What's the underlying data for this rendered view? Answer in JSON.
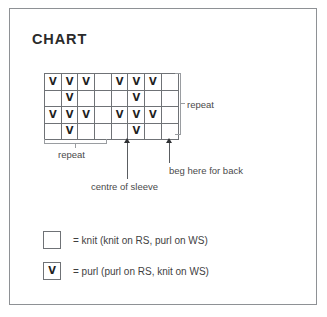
{
  "panel": {
    "title": "CHART"
  },
  "chart_data": {
    "type": "table",
    "title": "CHART",
    "columns": 8,
    "rows": 4,
    "symbols": {
      "knit": "",
      "purl": "V"
    },
    "grid": [
      [
        "V",
        "V",
        "V",
        "",
        "V",
        "V",
        "V",
        ""
      ],
      [
        "",
        "V",
        "",
        "",
        "",
        "V",
        "",
        ""
      ],
      [
        "V",
        "V",
        "V",
        "",
        "V",
        "V",
        "V",
        ""
      ],
      [
        "",
        "V",
        "",
        "",
        "",
        "V",
        "",
        ""
      ]
    ],
    "annotations": {
      "repeat_vertical": "repeat",
      "repeat_horizontal": "repeat",
      "centre_of_sleeve": "centre of sleeve",
      "beg_here_for_back": "beg here for back"
    },
    "repeat_horizontal_span_columns": [
      1,
      4
    ],
    "repeat_vertical_span_rows": [
      1,
      4
    ],
    "centre_of_sleeve_column": 5,
    "beg_here_for_back_column": 9
  },
  "legend": {
    "items": [
      {
        "symbol": "",
        "text": "= knit (knit on RS, purl on WS)"
      },
      {
        "symbol": "V",
        "text": "= purl (purl on RS, knit on WS)"
      }
    ]
  }
}
